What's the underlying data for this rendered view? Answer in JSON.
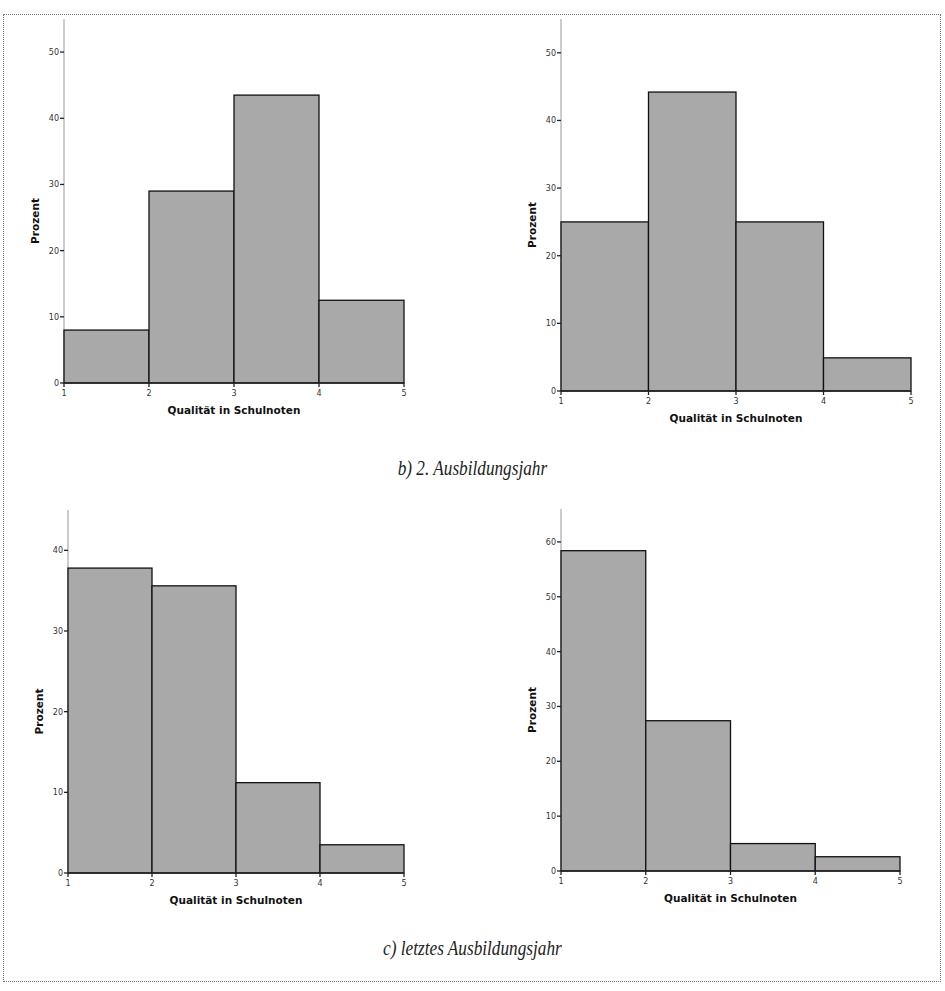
{
  "captions": {
    "b": "b) 2. Ausbildungsjahr",
    "c": "c) letztes Ausbildungsjahr"
  },
  "colors": {
    "bar_fill": "#a9a9a9",
    "bar_stroke": "#111111"
  },
  "chart_data": [
    {
      "type": "bar",
      "title": "",
      "position": "top-left",
      "xlabel": "Qualität in Schulnoten",
      "ylabel": "Prozent",
      "bins": [
        [
          1,
          2
        ],
        [
          2,
          3
        ],
        [
          3,
          4
        ],
        [
          4,
          5
        ]
      ],
      "values": [
        8.0,
        29.0,
        43.5,
        12.5
      ],
      "xticks": [
        "1",
        "2",
        "3",
        "4",
        "5"
      ],
      "yticks": [
        "0",
        "10",
        "20",
        "30",
        "40",
        "50"
      ],
      "xlim": [
        1,
        5
      ],
      "ylim": [
        0,
        55
      ],
      "grid": false
    },
    {
      "type": "bar",
      "title": "",
      "position": "top-right",
      "xlabel": "Qualität in Schulnoten",
      "ylabel": "Prozent",
      "bins": [
        [
          1,
          2
        ],
        [
          2,
          3
        ],
        [
          3,
          4
        ],
        [
          4,
          5
        ]
      ],
      "values": [
        25.0,
        44.2,
        25.0,
        4.9
      ],
      "xticks": [
        "1",
        "2",
        "3",
        "4",
        "5"
      ],
      "yticks": [
        "0",
        "10",
        "20",
        "30",
        "40",
        "50"
      ],
      "xlim": [
        1,
        5
      ],
      "ylim": [
        0,
        55
      ],
      "grid": false
    },
    {
      "type": "bar",
      "title": "",
      "position": "bottom-left",
      "xlabel": "Qualität in Schulnoten",
      "ylabel": "Prozent",
      "bins": [
        [
          1,
          2
        ],
        [
          2,
          3
        ],
        [
          3,
          4
        ],
        [
          4,
          5
        ]
      ],
      "values": [
        37.8,
        35.6,
        11.2,
        3.5
      ],
      "xticks": [
        "1",
        "2",
        "3",
        "4",
        "5"
      ],
      "yticks": [
        "0",
        "10",
        "20",
        "30",
        "40"
      ],
      "xlim": [
        1,
        5
      ],
      "ylim": [
        0,
        45
      ],
      "grid": false
    },
    {
      "type": "bar",
      "title": "",
      "position": "bottom-right",
      "xlabel": "Qualität in Schulnoten",
      "ylabel": "Prozent",
      "bins": [
        [
          1,
          2
        ],
        [
          2,
          3
        ],
        [
          3,
          4
        ],
        [
          4,
          5
        ]
      ],
      "values": [
        58.4,
        27.4,
        5.0,
        2.6
      ],
      "xticks": [
        "1",
        "2",
        "3",
        "4",
        "5"
      ],
      "yticks": [
        "0",
        "10",
        "20",
        "30",
        "40",
        "50",
        "60"
      ],
      "xlim": [
        1,
        5
      ],
      "ylim": [
        0,
        66
      ],
      "grid": false
    }
  ]
}
